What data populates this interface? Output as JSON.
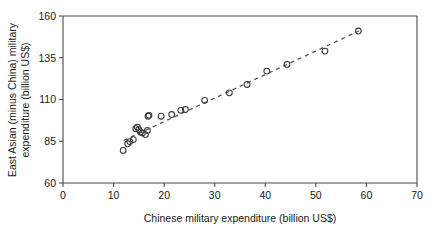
{
  "chart_data": {
    "type": "scatter",
    "title": "",
    "xlabel": "Chinese military expenditure (billion US$)",
    "ylabel": "East Asian (minus China) military expenditure (billion US$)",
    "ylabel_line1": "East Asian (minus China) military",
    "ylabel_line2": "expenditure (billion US$)",
    "xlim": [
      0,
      70
    ],
    "ylim": [
      60,
      160
    ],
    "xticks": [
      0,
      10,
      20,
      30,
      40,
      50,
      60,
      70
    ],
    "yticks": [
      60,
      85,
      110,
      135,
      160
    ],
    "xtick_labels": [
      "0",
      "10",
      "20",
      "30",
      "40",
      "50",
      "60",
      "70"
    ],
    "ytick_labels": [
      "60",
      "85",
      "110",
      "135",
      "160"
    ],
    "grid": false,
    "legend": "none",
    "marker": "open-circle",
    "marker_color": "#3a3a3a",
    "trendline": {
      "style": "dashed",
      "color": "#555555",
      "x_start": 12.0,
      "y_start": 85.5,
      "x_end": 58.5,
      "y_end": 151.0
    },
    "points": [
      {
        "x": 11.9,
        "y": 79.5
      },
      {
        "x": 12.8,
        "y": 83.5
      },
      {
        "x": 13.2,
        "y": 84.8
      },
      {
        "x": 13.9,
        "y": 86.0
      },
      {
        "x": 14.4,
        "y": 92.5
      },
      {
        "x": 14.7,
        "y": 93.5
      },
      {
        "x": 15.0,
        "y": 92.0
      },
      {
        "x": 15.3,
        "y": 90.5
      },
      {
        "x": 15.7,
        "y": 90.0
      },
      {
        "x": 16.3,
        "y": 89.0
      },
      {
        "x": 16.7,
        "y": 91.5
      },
      {
        "x": 16.8,
        "y": 100.0
      },
      {
        "x": 17.0,
        "y": 100.5
      },
      {
        "x": 19.4,
        "y": 100.0
      },
      {
        "x": 21.5,
        "y": 101.0
      },
      {
        "x": 23.3,
        "y": 103.5
      },
      {
        "x": 24.2,
        "y": 104.0
      },
      {
        "x": 28.0,
        "y": 109.5
      },
      {
        "x": 32.9,
        "y": 114.0
      },
      {
        "x": 36.4,
        "y": 119.0
      },
      {
        "x": 40.3,
        "y": 127.0
      },
      {
        "x": 44.3,
        "y": 131.0
      },
      {
        "x": 51.8,
        "y": 139.0
      },
      {
        "x": 58.4,
        "y": 151.0
      }
    ]
  }
}
